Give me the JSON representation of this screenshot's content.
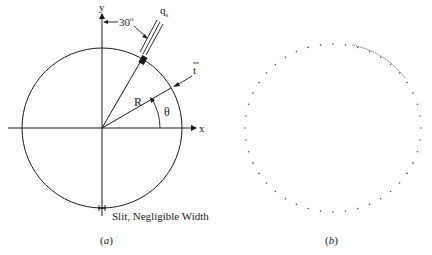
{
  "figure_a": {
    "axis_x_label": "x",
    "axis_y_label": "y",
    "angle_label": "30",
    "angle_degree_symbol": "o",
    "flux_label": "q",
    "flux_subscript": "s",
    "thickness_label": "t",
    "radius_label": "R",
    "theta_label": "θ",
    "slit_label": "Slit, Negligible Width",
    "caption_open": "(",
    "caption_letter": "a",
    "caption_close": ")"
  },
  "figure_b": {
    "caption_open": "(",
    "caption_letter": "b",
    "caption_close": ")"
  },
  "colors": {
    "line": "#1a1a1a",
    "dots": "#555555",
    "background": "#ffffff"
  }
}
